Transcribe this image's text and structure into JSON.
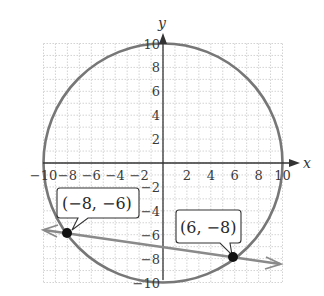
{
  "graph": {
    "x_axis_label": "x",
    "y_axis_label": "y",
    "x_range": [
      -10,
      10
    ],
    "y_range": [
      -10,
      10
    ],
    "grid_step": 1,
    "x_tick_labels": [
      {
        "value": -10,
        "label": "−10"
      },
      {
        "value": -8,
        "label": "−8"
      },
      {
        "value": -6,
        "label": "−6"
      },
      {
        "value": -4,
        "label": "−4"
      },
      {
        "value": -2,
        "label": "−2"
      },
      {
        "value": 2,
        "label": "2"
      },
      {
        "value": 4,
        "label": "4"
      },
      {
        "value": 6,
        "label": "6"
      },
      {
        "value": 8,
        "label": "8"
      },
      {
        "value": 10,
        "label": "10"
      }
    ],
    "y_tick_labels": [
      {
        "value": 10,
        "label": "10"
      },
      {
        "value": 8,
        "label": "8"
      },
      {
        "value": 6,
        "label": "6"
      },
      {
        "value": 4,
        "label": "4"
      },
      {
        "value": 2,
        "label": "2"
      },
      {
        "value": -2,
        "label": "−2"
      },
      {
        "value": -4,
        "label": "−4"
      },
      {
        "value": -6,
        "label": "−6"
      },
      {
        "value": -8,
        "label": "−8"
      },
      {
        "value": -10,
        "label": "−10"
      }
    ],
    "circle": {
      "center": [
        0,
        0
      ],
      "radius": 10,
      "color": "#777777"
    },
    "line": {
      "through": [
        [
          -8,
          -6
        ],
        [
          6,
          -8
        ]
      ],
      "color": "#8a8a8a",
      "arrows": "both"
    },
    "points": [
      {
        "x": -8,
        "y": -6,
        "label": "(−8, −6)"
      },
      {
        "x": 6,
        "y": -8,
        "label": "(6, −8)"
      }
    ],
    "colors": {
      "grid": "#c8c8c8",
      "axis": "#333333",
      "point": "#111111"
    }
  }
}
